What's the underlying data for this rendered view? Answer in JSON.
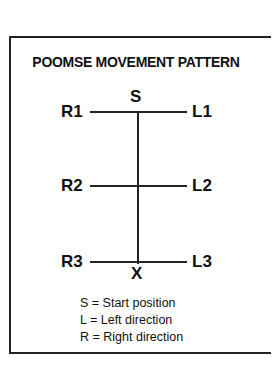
{
  "title": "POOMSE MOVEMENT PATTERN",
  "points": {
    "start": "S",
    "end": "X",
    "r1": "R1",
    "l1": "L1",
    "r2": "R2",
    "l2": "L2",
    "r3": "R3",
    "l3": "L3"
  },
  "legend": [
    "S = Start position",
    "L = Left direction",
    "R = Right direction"
  ]
}
